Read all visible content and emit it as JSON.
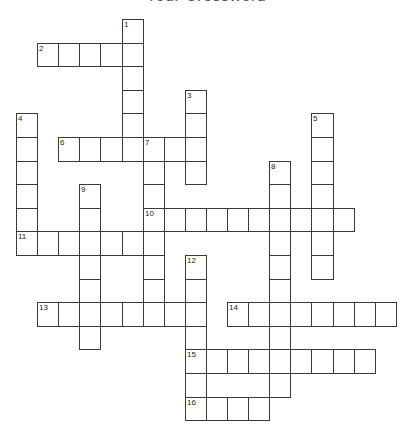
{
  "title": "Your Crossword",
  "grid": {
    "origin_x": 16,
    "origin_y": 19,
    "cell_w": 21.1,
    "cell_h": 23.6,
    "border_color": "#3a3a3a"
  },
  "across": [
    {
      "number": 2,
      "row": 1,
      "col": 1,
      "length": 5
    },
    {
      "number": 6,
      "row": 5,
      "col": 2,
      "length": 7
    },
    {
      "number": 10,
      "row": 8,
      "col": 6,
      "length": 10
    },
    {
      "number": 11,
      "row": 9,
      "col": 0,
      "length": 7
    },
    {
      "number": 13,
      "row": 12,
      "col": 1,
      "length": 8
    },
    {
      "number": 14,
      "row": 12,
      "col": 10,
      "length": 8
    },
    {
      "number": 15,
      "row": 14,
      "col": 8,
      "length": 9
    },
    {
      "number": 16,
      "row": 16,
      "col": 8,
      "length": 4
    }
  ],
  "down": [
    {
      "number": 1,
      "row": 0,
      "col": 5,
      "length": 6
    },
    {
      "number": 3,
      "row": 3,
      "col": 8,
      "length": 4
    },
    {
      "number": 4,
      "row": 4,
      "col": 0,
      "length": 6
    },
    {
      "number": 5,
      "row": 4,
      "col": 14,
      "length": 7
    },
    {
      "number": 7,
      "row": 5,
      "col": 6,
      "length": 8
    },
    {
      "number": 8,
      "row": 6,
      "col": 12,
      "length": 10
    },
    {
      "number": 9,
      "row": 7,
      "col": 3,
      "length": 7
    },
    {
      "number": 12,
      "row": 10,
      "col": 8,
      "length": 7
    }
  ]
}
